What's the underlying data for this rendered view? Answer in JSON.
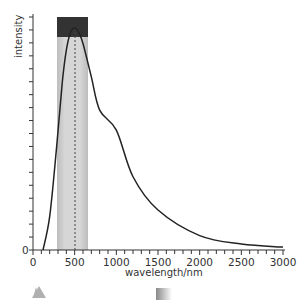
{
  "chart_data": {
    "type": "line",
    "title": "",
    "xlabel": "wavelength/nm",
    "ylabel": "intensity",
    "xlim": [
      0,
      3000
    ],
    "ylim": [
      0,
      1
    ],
    "x_ticks": [
      0,
      500,
      1000,
      1500,
      2000,
      2500,
      3000
    ],
    "x_tick_labels": [
      "0",
      "500",
      "1000",
      "1500",
      "2000",
      "2500",
      "3000"
    ],
    "x_minor_tick_step": 100,
    "y_tick_labels": [
      "0"
    ],
    "y_minor_tick_count": 18,
    "grid": false,
    "legend": null,
    "series": [
      {
        "name": "spectral intensity",
        "x": [
          120,
          200,
          280,
          350,
          400,
          450,
          500,
          550,
          600,
          700,
          800,
          1000,
          1200,
          1500,
          2000,
          2500,
          3000
        ],
        "y": [
          0.0,
          0.15,
          0.45,
          0.75,
          0.9,
          0.98,
          1.0,
          0.98,
          0.93,
          0.78,
          0.63,
          0.54,
          0.33,
          0.18,
          0.065,
          0.027,
          0.013
        ]
      }
    ],
    "annotations": [
      {
        "type": "vband",
        "label": "visible range",
        "x_start": 280,
        "x_end": 650,
        "color": "#c8c8c8"
      },
      {
        "type": "vline",
        "label": "peak wavelength",
        "x": 500,
        "style": "dashed"
      },
      {
        "type": "box",
        "label": "peak region marker",
        "x_start": 280,
        "x_end": 650,
        "color": "#333333"
      }
    ],
    "markers_below_axis": [
      {
        "shape": "triangle",
        "color": "#b0b0b0"
      },
      {
        "shape": "gradient-block",
        "color": "#888888"
      }
    ]
  },
  "labels": {
    "ylabel": "intensity",
    "xlabel": "wavelength/nm",
    "y_zero": "0",
    "x_ticks": [
      "0",
      "500",
      "1000",
      "1500",
      "2000",
      "2500",
      "3000"
    ]
  }
}
